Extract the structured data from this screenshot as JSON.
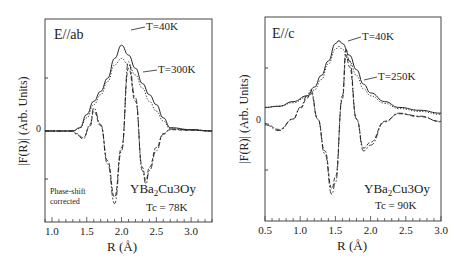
{
  "chart_data": [
    {
      "type": "line",
      "panel_label": "E//ab",
      "xlabel": "R (Å)",
      "ylabel": "|F(R)| (Arb. Units)",
      "xlim": [
        0.9,
        3.3
      ],
      "xticks": [
        "1.0",
        "1.5",
        "2.0",
        "2.5",
        "3.0"
      ],
      "yticks": [
        "0"
      ],
      "annotations": [
        "T=40K",
        "T=300K",
        "Phase-shift",
        "corrected",
        "YBa2Cu3Oy",
        "Tc = 78K"
      ],
      "series": [
        {
          "name": "|F(R)| T=40K",
          "style": "solid",
          "x": [
            0.9,
            1.3,
            1.4,
            1.5,
            1.6,
            1.7,
            1.8,
            1.9,
            2.0,
            2.1,
            2.2,
            2.3,
            2.4,
            2.5,
            2.6,
            2.7,
            3.0,
            3.3
          ],
          "y": [
            0,
            0,
            0.05,
            0.25,
            0.45,
            0.6,
            0.8,
            1.1,
            1.3,
            1.15,
            0.95,
            0.72,
            0.55,
            0.4,
            0.2,
            0.05,
            0.02,
            0
          ]
        },
        {
          "name": "|F(R)| T=300K",
          "style": "dotted",
          "x": [
            0.9,
            1.3,
            1.4,
            1.5,
            1.6,
            1.7,
            1.8,
            1.9,
            2.0,
            2.1,
            2.2,
            2.3,
            2.4,
            2.5,
            2.6,
            2.7,
            3.0,
            3.3
          ],
          "y": [
            0,
            0,
            0.04,
            0.2,
            0.4,
            0.55,
            0.75,
            1.0,
            1.1,
            1.0,
            0.85,
            0.65,
            0.45,
            0.3,
            0.15,
            0.03,
            0.01,
            0
          ]
        },
        {
          "name": "Im F(R) T=40K",
          "style": "dash-dot",
          "x": [
            0.9,
            1.3,
            1.35,
            1.45,
            1.55,
            1.6,
            1.7,
            1.8,
            1.9,
            2.0,
            2.1,
            2.2,
            2.3,
            2.35,
            2.4,
            2.5,
            2.6,
            2.7,
            3.0,
            3.3
          ],
          "y": [
            0,
            0,
            -0.05,
            -0.12,
            0.1,
            0.35,
            0.1,
            -0.5,
            -1.1,
            -0.3,
            1.05,
            0.5,
            -0.6,
            -0.8,
            -0.6,
            -0.3,
            -0.05,
            0.03,
            0.02,
            0
          ]
        },
        {
          "name": "Im F(R) T=300K",
          "style": "dashed",
          "x": [
            0.9,
            1.3,
            1.35,
            1.45,
            1.55,
            1.6,
            1.7,
            1.8,
            1.9,
            2.0,
            2.1,
            2.2,
            2.3,
            2.35,
            2.4,
            2.5,
            2.6,
            2.7,
            3.0,
            3.3
          ],
          "y": [
            0,
            0,
            -0.04,
            -0.1,
            0.08,
            0.3,
            0.08,
            -0.45,
            -1.0,
            -0.25,
            0.95,
            0.45,
            -0.55,
            -0.75,
            -0.55,
            -0.25,
            -0.04,
            0.02,
            0.01,
            0
          ]
        }
      ]
    },
    {
      "type": "line",
      "panel_label": "E//c",
      "xlabel": "R (Å)",
      "ylabel": "|F(R)| (Arb. Units)",
      "xlim": [
        0.5,
        3.0
      ],
      "xticks": [
        "0.5",
        "1.0",
        "1.5",
        "2.0",
        "2.5",
        "3.0"
      ],
      "yticks": [
        "0"
      ],
      "annotations": [
        "T=40K",
        "T=250K",
        "YBa2Cu3Oy",
        "Tc = 90K"
      ],
      "series": [
        {
          "name": "|F(R)| T=40K",
          "style": "solid",
          "x": [
            0.5,
            0.7,
            0.9,
            1.1,
            1.2,
            1.3,
            1.4,
            1.5,
            1.55,
            1.6,
            1.7,
            1.8,
            1.9,
            2.0,
            2.2,
            2.4,
            2.7,
            3.0
          ],
          "y": [
            0.2,
            0.22,
            0.3,
            0.4,
            0.55,
            0.75,
            1.0,
            1.3,
            1.35,
            1.3,
            1.1,
            0.85,
            0.6,
            0.45,
            0.3,
            0.2,
            0.15,
            0.1
          ]
        },
        {
          "name": "|F(R)| T=250K",
          "style": "dotted",
          "x": [
            0.5,
            0.7,
            0.9,
            1.1,
            1.2,
            1.3,
            1.4,
            1.5,
            1.55,
            1.6,
            1.7,
            1.8,
            1.9,
            2.0,
            2.2,
            2.4,
            2.7,
            3.0
          ],
          "y": [
            0.2,
            0.22,
            0.28,
            0.38,
            0.5,
            0.68,
            0.95,
            1.2,
            1.25,
            1.2,
            1.0,
            0.75,
            0.52,
            0.4,
            0.27,
            0.18,
            0.13,
            0.08
          ]
        },
        {
          "name": "Im F(R) T=40K",
          "style": "dash-dot",
          "x": [
            0.5,
            0.7,
            0.9,
            1.0,
            1.1,
            1.15,
            1.25,
            1.35,
            1.45,
            1.5,
            1.6,
            1.65,
            1.7,
            1.8,
            1.9,
            2.0,
            2.2,
            2.4,
            2.7,
            3.0
          ],
          "y": [
            -0.1,
            -0.2,
            0.0,
            0.2,
            0.4,
            0.5,
            0.0,
            -0.6,
            -1.3,
            -1.1,
            0.4,
            1.2,
            1.0,
            0.0,
            -0.55,
            -0.45,
            -0.05,
            0.1,
            0.05,
            -0.05
          ]
        },
        {
          "name": "Im F(R) T=250K",
          "style": "dashed",
          "x": [
            0.5,
            0.7,
            0.9,
            1.0,
            1.1,
            1.15,
            1.25,
            1.35,
            1.45,
            1.5,
            1.6,
            1.65,
            1.7,
            1.8,
            1.9,
            2.0,
            2.2,
            2.4,
            2.7,
            3.0
          ],
          "y": [
            -0.08,
            -0.18,
            0.0,
            0.18,
            0.36,
            0.45,
            0.0,
            -0.55,
            -1.2,
            -1.0,
            0.35,
            1.1,
            0.9,
            0.0,
            -0.5,
            -0.4,
            -0.04,
            0.09,
            0.04,
            -0.04
          ]
        }
      ]
    }
  ],
  "labels": {
    "left_panel": "E//ab",
    "left_t1": "T=40K",
    "left_t2": "T=300K",
    "phase1": "Phase-shift",
    "phase2": "corrected",
    "left_compound_main": "YBa",
    "left_compound_sub": "2",
    "left_compound_rest": "Cu3Oy",
    "left_tc": "Tc = 78K",
    "right_panel": "E//c",
    "right_t1": "T=40K",
    "right_t2": "T=250K",
    "right_compound_main": "YBa",
    "right_compound_sub": "2",
    "right_compound_rest": "Cu3Oy",
    "right_tc": "Tc = 90K",
    "ylabel": "|F(R)| (Arb. Units)",
    "xlabel": "R (Å)",
    "zero": "0",
    "left_xticks": [
      "1.0",
      "1.5",
      "2.0",
      "2.5",
      "3.0"
    ],
    "right_xticks": [
      "0.5",
      "1.0",
      "1.5",
      "2.0",
      "2.5",
      "3.0"
    ]
  }
}
